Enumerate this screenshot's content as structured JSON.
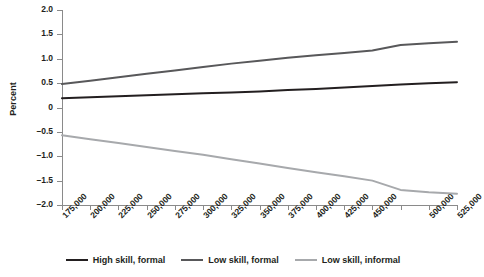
{
  "chart_data": {
    "type": "line",
    "title": "",
    "xlabel": "",
    "ylabel": "Percent",
    "grid": false,
    "legend_position": "bottom",
    "ylim": [
      -2.0,
      2.0
    ],
    "yticks": [
      2.0,
      1.5,
      1.0,
      0.5,
      0,
      -0.5,
      -1.0,
      -1.5,
      -2.0
    ],
    "ytick_labels": [
      "2.0",
      "1.5",
      "1.0",
      "0.5",
      "0",
      "–0.5",
      "–1.0",
      "–1.5",
      "–2.0"
    ],
    "categories": [
      175000,
      200000,
      225000,
      250000,
      275000,
      300000,
      325000,
      350000,
      375000,
      400000,
      425000,
      450000,
      475000,
      500000,
      525000
    ],
    "xtick_labels": [
      "175,000",
      "200,000",
      "225,000",
      "250,000",
      "275,000",
      "300,000",
      "325,000",
      "350,000",
      "375,000",
      "400,000",
      "425,000",
      "450,000",
      "",
      "500,000",
      "525,000"
    ],
    "series": [
      {
        "name": "High skill, formal",
        "color": "#231f20",
        "values": [
          0.19,
          0.21,
          0.23,
          0.25,
          0.27,
          0.29,
          0.31,
          0.33,
          0.36,
          0.38,
          0.41,
          0.44,
          0.47,
          0.5,
          0.52
        ]
      },
      {
        "name": "Low skill, formal",
        "color": "#58585a",
        "values": [
          0.48,
          0.55,
          0.62,
          0.69,
          0.76,
          0.83,
          0.9,
          0.96,
          1.02,
          1.07,
          1.12,
          1.17,
          1.28,
          1.32,
          1.35
        ]
      },
      {
        "name": "Low skill, informal",
        "color": "#a7a9ac",
        "values": [
          -0.57,
          -0.65,
          -0.73,
          -0.81,
          -0.89,
          -0.97,
          -1.06,
          -1.15,
          -1.24,
          -1.33,
          -1.41,
          -1.5,
          -1.69,
          -1.74,
          -1.77
        ]
      }
    ]
  },
  "legend": {
    "items": [
      {
        "label": "High skill, formal"
      },
      {
        "label": "Low skill, formal"
      },
      {
        "label": "Low skill, informal"
      }
    ]
  }
}
